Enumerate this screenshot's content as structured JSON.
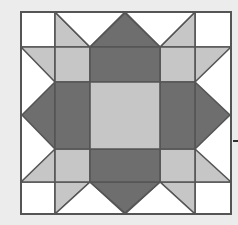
{
  "diagram": {
    "type": "quilt-block",
    "colors": {
      "background": "#ececec",
      "white": "#ffffff",
      "light": "#c6c6c6",
      "dark": "#6e6e6e",
      "line": "#555555"
    },
    "bounds": {
      "x0": 21,
      "y0": 12,
      "x1": 231,
      "y1": 214
    },
    "grid": {
      "cols": [
        21,
        55,
        90,
        160,
        195,
        231
      ],
      "rows": [
        12,
        47,
        82,
        149,
        182,
        214
      ],
      "mid_x": 125,
      "mid_y": 115
    }
  }
}
